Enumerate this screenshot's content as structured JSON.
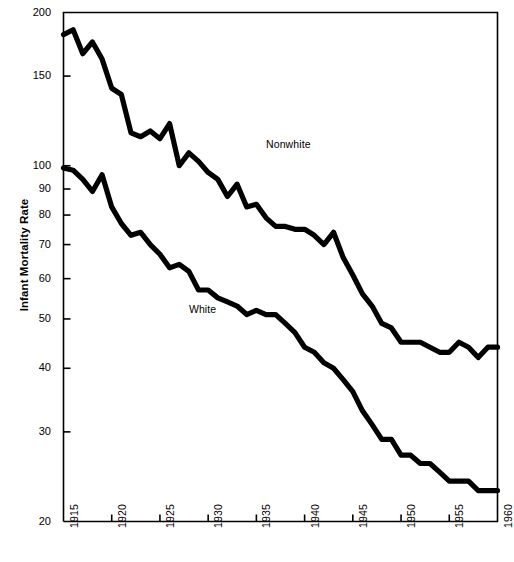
{
  "chart_data": {
    "type": "line",
    "title": "",
    "subtitle": "",
    "xlabel": "",
    "ylabel": "Infant Mortality Rate",
    "xlim": [
      1915,
      1960
    ],
    "ylim": [
      20,
      200
    ],
    "yscale": "log",
    "grid": false,
    "legend_position": "inline-annotations",
    "x_ticks": [
      1915,
      1920,
      1925,
      1930,
      1935,
      1940,
      1945,
      1950,
      1955,
      1960
    ],
    "x_tick_labels": [
      "1915",
      "1920",
      "1925",
      "1930",
      "1935",
      "1940",
      "1945",
      "1950",
      "1955",
      "1960"
    ],
    "y_ticks": [
      20,
      30,
      40,
      50,
      60,
      70,
      80,
      90,
      100,
      150,
      200
    ],
    "y_tick_labels": [
      "20",
      "30",
      "40",
      "50",
      "60",
      "70",
      "80",
      "90",
      "100",
      "150",
      "200"
    ],
    "x": [
      1915,
      1916,
      1917,
      1918,
      1919,
      1920,
      1921,
      1922,
      1923,
      1924,
      1925,
      1926,
      1927,
      1928,
      1929,
      1930,
      1931,
      1932,
      1933,
      1934,
      1935,
      1936,
      1937,
      1938,
      1939,
      1940,
      1941,
      1942,
      1943,
      1944,
      1945,
      1946,
      1947,
      1948,
      1949,
      1950,
      1951,
      1952,
      1953,
      1954,
      1955,
      1956,
      1957,
      1958,
      1959,
      1960
    ],
    "series": [
      {
        "name": "Nonwhite",
        "values": [
          181,
          185,
          166,
          175,
          162,
          142,
          138,
          116,
          114,
          117,
          113,
          121,
          100,
          106,
          102,
          97,
          94,
          87,
          92,
          83,
          84,
          79,
          76,
          76,
          75,
          75,
          73,
          70,
          74,
          66,
          61,
          56,
          53,
          49,
          48,
          45,
          45,
          45,
          44,
          43,
          43,
          45,
          44,
          42,
          44,
          44
        ],
        "annotation": "Nonwhite"
      },
      {
        "name": "White",
        "values": [
          99,
          98,
          94,
          89,
          96,
          83,
          77,
          73,
          74,
          70,
          67,
          63,
          64,
          62,
          57,
          57,
          55,
          54,
          53,
          51,
          52,
          51,
          51,
          49,
          47,
          44,
          43,
          41,
          40,
          38,
          36,
          33,
          31,
          29,
          29,
          27,
          27,
          26,
          26,
          25,
          24,
          24,
          24,
          23,
          23,
          23
        ],
        "annotation": "White"
      }
    ],
    "annotations": [
      {
        "text": "Nonwhite",
        "x": 1936,
        "y": 110
      },
      {
        "text": "White",
        "x": 1928,
        "y": 52
      }
    ],
    "colors": {
      "line": "#000000",
      "background": "#ffffff",
      "axis": "#000000"
    }
  },
  "axis": {
    "y_title": "Infant Mortality Rate"
  }
}
